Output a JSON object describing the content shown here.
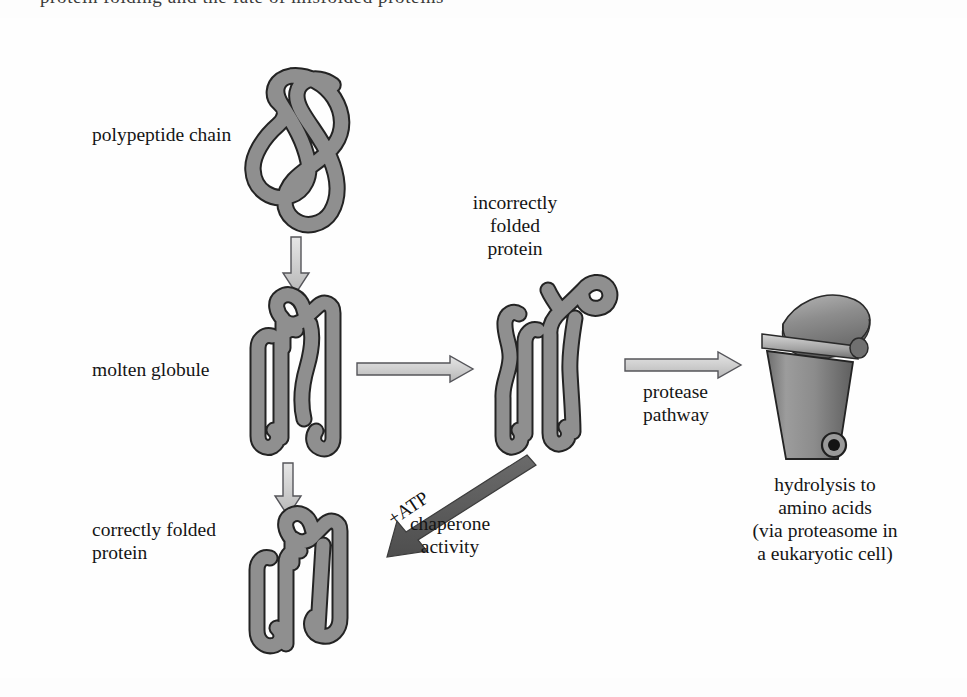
{
  "figure": {
    "domain": "Diagram",
    "title_cut_off_top": "protein folding and the fate of misfolded proteins",
    "background_color": "#fefefe",
    "ink_color": "#151515",
    "ribbon_fill": "#8f8f8f",
    "ribbon_stroke": "#1a1a1a",
    "light_arrow_fill": "#d2d2d2",
    "light_arrow_stroke": "#4a4a4a",
    "dark_arrow_fill": "#5a5a5a",
    "bin_body_fill": "#8a8a8a",
    "bin_lid_fill": "#9a9a9a"
  },
  "labels": {
    "polypeptide_chain": "polypeptide chain",
    "molten_globule": "molten globule",
    "correctly_folded_protein": "correctly folded\nprotein",
    "incorrectly_folded_protein": "incorrectly\nfolded\nprotein",
    "protease_pathway": "protease\npathway",
    "hydrolysis": "hydrolysis to\namino acids\n(via proteasome in\na eukaryotic cell)",
    "atp": "+ATP",
    "chaperone_activity": "chaperone\nactivity"
  },
  "shapes": {
    "polypeptide_chain": "unfolded-looping-ribbon",
    "molten_globule": "partially-folded-ribbon",
    "correctly_folded_protein": "compact-folded-ribbon",
    "incorrectly_folded_protein": "misfolded-ribbon-with-loose-tail",
    "waste_bin": "trash-can-open-lid-with-wheel"
  },
  "arrows": [
    {
      "name": "chain-to-globule",
      "style": "light-outline",
      "direction": "down",
      "label": ""
    },
    {
      "name": "globule-to-correct",
      "style": "light-outline",
      "direction": "down",
      "label": ""
    },
    {
      "name": "globule-to-misfolded",
      "style": "light-outline",
      "direction": "right",
      "label": ""
    },
    {
      "name": "misfolded-to-bin",
      "style": "light-outline",
      "direction": "right",
      "label": "protease pathway"
    },
    {
      "name": "misfolded-to-correct",
      "style": "dark-solid",
      "direction": "down-left",
      "label": "+ATP / chaperone activity"
    }
  ]
}
